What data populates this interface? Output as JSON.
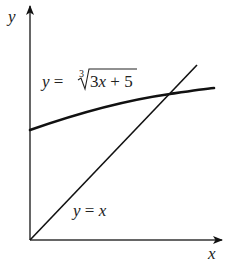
{
  "diagram": {
    "axes": {
      "x_label": "x",
      "y_label": "y"
    },
    "curves": [
      {
        "name": "cube-root-curve",
        "label_prefix": "y =",
        "root_index": "3",
        "radicand": "3x + 5",
        "label_full": "y = ∛(3x+5)"
      },
      {
        "name": "identity-line",
        "label": "y = x"
      }
    ],
    "colors": {
      "stroke": "#111111",
      "text": "#222222",
      "background": "#ffffff"
    }
  }
}
